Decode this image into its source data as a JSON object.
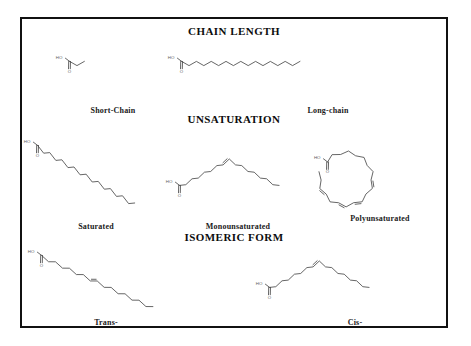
{
  "figure": {
    "border_color": "#111111",
    "background_color": "#ffffff",
    "bond_color": "#4a4a4a",
    "text_color": "#1a1a1a"
  },
  "sections": [
    {
      "id": "chain-length",
      "heading": "CHAIN LENGTH",
      "molecules": [
        {
          "id": "short-chain",
          "label": "Short-Chain",
          "hydroxyl_label": "HO",
          "carbonyl_label": "O",
          "carbon_count": 4,
          "double_bonds": 0,
          "geometry": "zigzag-horizontal",
          "description": "Butyric acid, short-chain saturated fatty acid"
        },
        {
          "id": "long-chain",
          "label": "Long-chain",
          "hydroxyl_label": "HO",
          "carbonyl_label": "O",
          "carbon_count": 18,
          "double_bonds": 0,
          "geometry": "zigzag-horizontal",
          "description": "Stearic acid, long-chain saturated fatty acid"
        }
      ]
    },
    {
      "id": "unsaturation",
      "heading": "UNSATURATION",
      "molecules": [
        {
          "id": "saturated",
          "label": "Saturated",
          "hydroxyl_label": "HO",
          "carbonyl_label": "O",
          "carbon_count": 18,
          "double_bonds": 0,
          "geometry": "zigzag-diagonal-down",
          "description": "Fully saturated straight chain, no double bonds"
        },
        {
          "id": "monounsaturated",
          "label": "Monounsaturated",
          "hydroxyl_label": "HO",
          "carbonyl_label": "O",
          "carbon_count": 18,
          "double_bonds": 1,
          "geometry": "cis-bent-single-kink",
          "description": "One cis double bond producing a single bend"
        },
        {
          "id": "polyunsaturated",
          "label": "Polyunsaturated",
          "hydroxyl_label": "HO",
          "carbonyl_label": "O",
          "carbon_count": 20,
          "double_bonds": 4,
          "geometry": "curled-horseshoe",
          "description": "Multiple cis double bonds producing a curled chain"
        }
      ]
    },
    {
      "id": "isomeric-form",
      "heading": "ISOMERIC FORM",
      "molecules": [
        {
          "id": "trans",
          "label": "Trans-",
          "hydroxyl_label": "HO",
          "carbonyl_label": "O",
          "carbon_count": 18,
          "double_bonds": 1,
          "geometry": "trans-straight-diagonal",
          "description": "Trans double bond, chain remains straight"
        },
        {
          "id": "cis",
          "label": "Cis-",
          "hydroxyl_label": "HO",
          "carbonyl_label": "O",
          "carbon_count": 18,
          "double_bonds": 1,
          "geometry": "cis-bent-single-kink",
          "description": "Cis double bond, chain bends at the double bond"
        }
      ]
    }
  ]
}
